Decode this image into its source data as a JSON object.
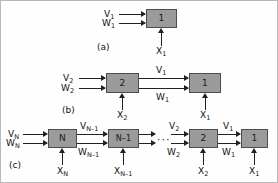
{
  "figure": {
    "background": "#fefefe",
    "box_fill": "#9b9b9b",
    "box_border": "#4d4d4d",
    "line_color": "#222222",
    "panels": [
      {
        "id": "a",
        "caption": "(a)",
        "units": [
          {
            "label": "1"
          }
        ],
        "inputs": [
          {
            "name": "V-input-1",
            "text": "V",
            "sub": "1"
          },
          {
            "name": "W-input-1",
            "text": "W",
            "sub": "1"
          },
          {
            "name": "X-input-1",
            "text": "X",
            "sub": "1"
          }
        ]
      },
      {
        "id": "b",
        "caption": "(b)",
        "units": [
          {
            "label": "2"
          },
          {
            "label": "1"
          }
        ],
        "inputs": [
          {
            "name": "V-input-2",
            "text": "V",
            "sub": "2"
          },
          {
            "name": "W-input-2",
            "text": "W",
            "sub": "2"
          },
          {
            "name": "X-input-2",
            "text": "X",
            "sub": "2"
          },
          {
            "name": "X-input-1",
            "text": "X",
            "sub": "1"
          }
        ],
        "interconnects": [
          {
            "name": "V-link-1",
            "text": "V",
            "sub": "1"
          },
          {
            "name": "W-link-1",
            "text": "W",
            "sub": "1"
          }
        ]
      },
      {
        "id": "c",
        "caption": "(c)",
        "units": [
          {
            "label": "N"
          },
          {
            "label": "N–1"
          },
          {
            "label": "2"
          },
          {
            "label": "1"
          }
        ],
        "ellipsis": "···",
        "inputs": [
          {
            "name": "V-input-N",
            "text": "V",
            "sub": "N"
          },
          {
            "name": "W-input-N",
            "text": "W",
            "sub": "N"
          },
          {
            "name": "X-input-N",
            "text": "X",
            "sub": "N"
          },
          {
            "name": "X-input-N-1",
            "text": "X",
            "sub": "N–1"
          },
          {
            "name": "X-input-2",
            "text": "X",
            "sub": "2"
          },
          {
            "name": "X-input-1",
            "text": "X",
            "sub": "1"
          }
        ],
        "interconnects": [
          {
            "name": "V-link-N-1",
            "text": "V",
            "sub": "N–1"
          },
          {
            "name": "W-link-N-1",
            "text": "W",
            "sub": "N–1"
          },
          {
            "name": "V-link-2",
            "text": "V",
            "sub": "2"
          },
          {
            "name": "W-link-2",
            "text": "W",
            "sub": "2"
          },
          {
            "name": "V-link-1",
            "text": "V",
            "sub": "1"
          },
          {
            "name": "W-link-1",
            "text": "W",
            "sub": "1"
          }
        ]
      }
    ]
  }
}
